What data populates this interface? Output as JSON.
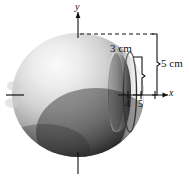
{
  "figure": {
    "kind": "solid-of-revolution-diagram",
    "axes": {
      "y_label": "y",
      "x_label": "x"
    },
    "ticks": [
      {
        "label": "4",
        "value": 4
      },
      {
        "label": "5",
        "value": 5
      }
    ],
    "dimensions": [
      {
        "label": "3 cm",
        "value": 3,
        "unit": "cm",
        "measures": "hole-radius"
      },
      {
        "label": "5 cm",
        "value": 5,
        "unit": "cm",
        "measures": "sphere-radius"
      }
    ],
    "colors": {
      "stroke": "#111111",
      "sphere_light": "#f2f2f2",
      "sphere_mid": "#b8b8b8",
      "sphere_dark": "#3a3a3a",
      "sphere_edge": "#1c1c1c",
      "cavity_light": "#fdfdfd",
      "cavity_dark": "#4a4a4a",
      "background": "#ffffff"
    }
  }
}
